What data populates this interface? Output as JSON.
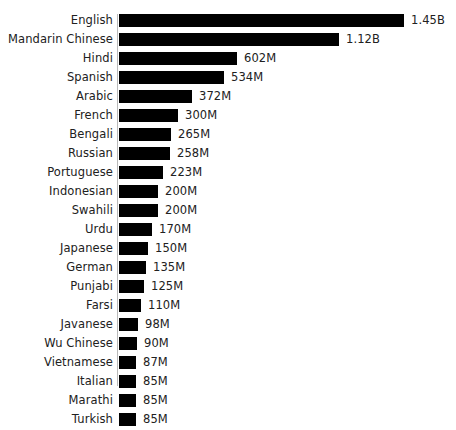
{
  "chart_data": {
    "type": "bar",
    "orientation": "horizontal",
    "title": "",
    "subtitle": "",
    "xlabel": "",
    "ylabel": "",
    "grid": false,
    "legend": null,
    "axis_line": true,
    "value_unit": "speakers",
    "xlim": [
      0,
      1450
    ],
    "categories": [
      "English",
      "Mandarin Chinese",
      "Hindi",
      "Spanish",
      "Arabic",
      "French",
      "Bengali",
      "Russian",
      "Portuguese",
      "Indonesian",
      "Swahili",
      "Urdu",
      "Japanese",
      "German",
      "Punjabi",
      "Farsi",
      "Javanese",
      "Wu Chinese",
      "Vietnamese",
      "Italian",
      "Marathi",
      "Turkish"
    ],
    "values": [
      1450,
      1120,
      602,
      534,
      372,
      300,
      265,
      258,
      223,
      200,
      200,
      170,
      150,
      135,
      125,
      110,
      98,
      90,
      87,
      85,
      85,
      85
    ],
    "value_labels": [
      "1.45B",
      "1.12B",
      "602M",
      "534M",
      "372M",
      "300M",
      "265M",
      "258M",
      "223M",
      "200M",
      "200M",
      "170M",
      "150M",
      "135M",
      "125M",
      "110M",
      "98M",
      "90M",
      "87M",
      "85M",
      "85M",
      "85M"
    ],
    "colors": {
      "bar": "#000000",
      "text": "#212121",
      "background": "#ffffff",
      "axis": "#b9b9b9"
    }
  }
}
